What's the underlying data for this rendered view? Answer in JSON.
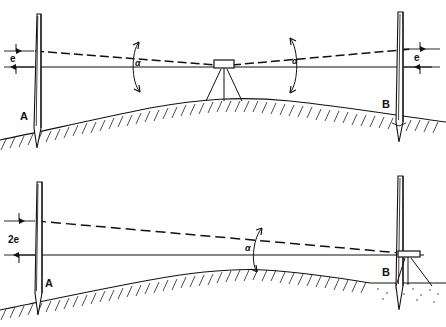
{
  "figure": {
    "background_color": "#ffffff",
    "line_color": "#111111",
    "panel_count": 2
  },
  "panels": [
    {
      "id": "upper-panel",
      "name": "instrument-midway-between-staves",
      "description": "Level set up midway between staff A and staff B; equal collimation error e observed at both staves.",
      "instrument": {
        "name": "level-instrument",
        "position": "midway",
        "support": "tripod",
        "leg_count": 3
      },
      "staves": [
        {
          "id": "staff-a",
          "label": "A",
          "side": "left"
        },
        {
          "id": "staff-b",
          "label": "B",
          "side": "right"
        }
      ],
      "dimensions": [
        {
          "id": "error-left",
          "label": "e",
          "side": "left",
          "meaning": "collimation error at staff A"
        },
        {
          "id": "error-right",
          "label": "e",
          "side": "right",
          "meaning": "collimation error at staff B"
        }
      ],
      "angles": [
        {
          "id": "angle-left",
          "label": "α",
          "side": "left"
        },
        {
          "id": "angle-right",
          "label": "α",
          "side": "right"
        }
      ],
      "lines": [
        {
          "id": "line-of-collimation",
          "style": "dashed",
          "meaning": "actual (tilted) line of sight"
        },
        {
          "id": "horizontal-line",
          "style": "solid",
          "meaning": "true horizontal line"
        }
      ],
      "ground": {
        "id": "ground-profile",
        "style": "convex-arc",
        "hatching": true
      }
    },
    {
      "id": "lower-panel",
      "name": "instrument-near-staff-b",
      "description": "Level set up close to staff B; the collimation error accumulates to 2e at the distant staff A.",
      "instrument": {
        "name": "level-instrument",
        "position": "adjacent-to-staff-b",
        "support": "tripod",
        "leg_count": 3
      },
      "staves": [
        {
          "id": "staff-a",
          "label": "A",
          "side": "left"
        },
        {
          "id": "staff-b",
          "label": "B",
          "side": "right"
        }
      ],
      "dimensions": [
        {
          "id": "error-left-double",
          "label": "2e",
          "side": "left",
          "meaning": "doubled collimation error at staff A"
        }
      ],
      "angles": [
        {
          "id": "angle-center",
          "label": "α",
          "side": "center"
        }
      ],
      "lines": [
        {
          "id": "line-of-collimation",
          "style": "dashed",
          "meaning": "actual (tilted) line of sight"
        },
        {
          "id": "horizontal-line",
          "style": "solid",
          "meaning": "true horizontal line"
        }
      ],
      "ground": {
        "id": "ground-profile",
        "style": "convex-arc-with-flat-right",
        "hatching": true
      }
    }
  ],
  "symbols": {
    "alpha": "α",
    "error": "e",
    "double_error": "2e",
    "point_a": "A",
    "point_b": "B"
  }
}
